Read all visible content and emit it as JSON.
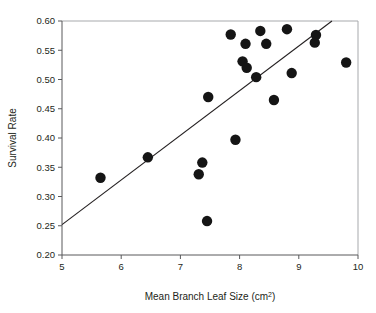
{
  "chart_data": {
    "type": "scatter",
    "title": "",
    "xlabel": "Mean Branch Leaf Size (cm2)",
    "xlabel_base": "Mean Branch Leaf Size (cm",
    "xlabel_sup": "2",
    "xlabel_tail": ")",
    "ylabel": "Survival Rate",
    "xlim": [
      5,
      10
    ],
    "ylim": [
      0.2,
      0.6
    ],
    "xticks": [
      5,
      6,
      7,
      8,
      9,
      10
    ],
    "xtick_labels": [
      "5",
      "6",
      "7",
      "8",
      "9",
      "10"
    ],
    "yticks": [
      0.2,
      0.25,
      0.3,
      0.35,
      0.4,
      0.45,
      0.5,
      0.55,
      0.6
    ],
    "ytick_labels": [
      "0.20",
      "0.25",
      "0.30",
      "0.35",
      "0.40",
      "0.45",
      "0.50",
      "0.55",
      "0.60"
    ],
    "grid": false,
    "legend": "none",
    "marker_color": "#151515",
    "marker_size": 5.2,
    "line_color": "#231f20",
    "axis_color": "#58595b",
    "background": "#ffffff",
    "points": [
      {
        "x": 5.65,
        "y": 0.332
      },
      {
        "x": 6.45,
        "y": 0.367
      },
      {
        "x": 7.31,
        "y": 0.338
      },
      {
        "x": 7.37,
        "y": 0.358
      },
      {
        "x": 7.45,
        "y": 0.258
      },
      {
        "x": 7.47,
        "y": 0.47
      },
      {
        "x": 7.85,
        "y": 0.577
      },
      {
        "x": 7.93,
        "y": 0.397
      },
      {
        "x": 8.05,
        "y": 0.531
      },
      {
        "x": 8.1,
        "y": 0.561
      },
      {
        "x": 8.12,
        "y": 0.52
      },
      {
        "x": 8.28,
        "y": 0.504
      },
      {
        "x": 8.35,
        "y": 0.583
      },
      {
        "x": 8.45,
        "y": 0.561
      },
      {
        "x": 8.58,
        "y": 0.465
      },
      {
        "x": 8.8,
        "y": 0.586
      },
      {
        "x": 8.88,
        "y": 0.511
      },
      {
        "x": 9.27,
        "y": 0.563
      },
      {
        "x": 9.29,
        "y": 0.576
      },
      {
        "x": 9.8,
        "y": 0.529
      }
    ],
    "fit_line": {
      "x_start": 5.0,
      "y_start": 0.252,
      "x_end": 9.56,
      "y_end": 0.6
    }
  }
}
